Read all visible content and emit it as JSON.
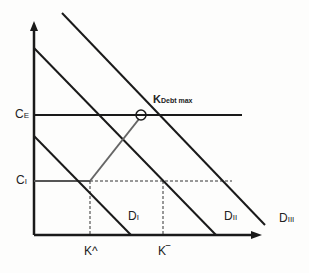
{
  "diagram": {
    "axes": {
      "y_axis_label": "",
      "x_axis_label": ""
    },
    "y_labels": {
      "ce": {
        "main": "C",
        "sub": "E"
      },
      "ci": {
        "main": "C",
        "sub": "I"
      }
    },
    "x_labels": {
      "k_hat": "K^",
      "k_bar": "K‾"
    },
    "curves": {
      "d1": {
        "main": "D",
        "sub": "I"
      },
      "d2": {
        "main": "D",
        "sub": "II"
      },
      "d3": {
        "main": "D",
        "sub": "III"
      }
    },
    "annotation": {
      "main": "K",
      "sub": "Debt max"
    },
    "colors": {
      "line": "#1a1a1a",
      "path": "#666666",
      "dashed": "#333333"
    }
  }
}
